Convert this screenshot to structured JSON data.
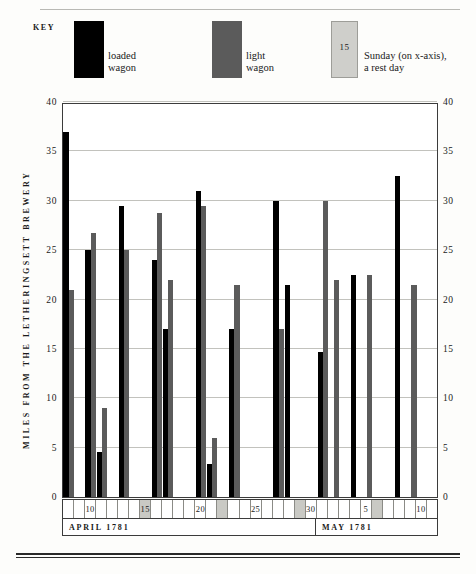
{
  "key": {
    "label": "KEY",
    "loaded_label": "loaded\nwagon",
    "loaded_line1": "loaded",
    "loaded_line2": "wagon",
    "light_line1": "light",
    "light_line2": "wagon",
    "sunday_swatch_number": "15",
    "sunday_line1": "Sunday (on x-axis),",
    "sunday_line2": "a rest day"
  },
  "colors": {
    "loaded_wagon": "#000000",
    "light_wagon": "#5b5b5b",
    "sunday_cell": "#c9c9c4",
    "gridline": "#c2c2bd",
    "axis": "#3b3b3b"
  },
  "chart_data": {
    "type": "bar",
    "title": "",
    "xlabel": "",
    "ylabel": "MILES FROM THE LETHERINGSETT BREWERY",
    "ylim": [
      0,
      40
    ],
    "yticks": [
      0,
      5,
      10,
      15,
      20,
      25,
      30,
      35,
      40
    ],
    "ytick_labels": [
      "0",
      "5",
      "10",
      "15",
      "20",
      "25",
      "30",
      "35",
      "40"
    ],
    "ytick_labels_right": [
      "0",
      "5",
      "10",
      "15",
      "20",
      "25",
      "30",
      "35",
      "40"
    ],
    "grid": true,
    "legend_position": "top",
    "series": [
      {
        "name": "loaded wagon",
        "color": "#000000"
      },
      {
        "name": "light wagon",
        "color": "#5b5b5b"
      }
    ],
    "months": [
      {
        "label": "APRIL  1781",
        "days": 23
      },
      {
        "label": "MAY  1781",
        "days": 11
      }
    ],
    "categories": [
      "8",
      "9",
      "10",
      "11",
      "12",
      "13",
      "14",
      "15",
      "16",
      "17",
      "18",
      "19",
      "20",
      "21",
      "22",
      "23",
      "24",
      "25",
      "26",
      "27",
      "28",
      "29",
      "30",
      "1",
      "2",
      "3",
      "4",
      "5",
      "6",
      "7",
      "8",
      "9",
      "10",
      "11"
    ],
    "tick_labels": {
      "10": "10",
      "15": "15",
      "20": "20",
      "25": "25",
      "30": "30",
      "1-May": "5",
      "10-May": "10"
    },
    "labelled_days": [
      "10",
      "15",
      "20",
      "25",
      "30",
      "5",
      "10"
    ],
    "sundays": [
      "15",
      "22",
      "29",
      "6"
    ],
    "days": [
      {
        "day": "8",
        "month": "APRIL",
        "sunday": false,
        "label": "",
        "loaded": 37,
        "light": 21
      },
      {
        "day": "9",
        "month": "APRIL",
        "sunday": false,
        "label": "",
        "loaded": 0,
        "light": 0
      },
      {
        "day": "10",
        "month": "APRIL",
        "sunday": false,
        "label": "10",
        "loaded": 25,
        "light": 26.7
      },
      {
        "day": "11",
        "month": "APRIL",
        "sunday": false,
        "label": "",
        "loaded": 4.6,
        "light": 9
      },
      {
        "day": "12",
        "month": "APRIL",
        "sunday": false,
        "label": "",
        "loaded": 0,
        "light": 0
      },
      {
        "day": "13",
        "month": "APRIL",
        "sunday": false,
        "label": "",
        "loaded": 29.5,
        "light": 25
      },
      {
        "day": "14",
        "month": "APRIL",
        "sunday": false,
        "label": "",
        "loaded": 0,
        "light": 0
      },
      {
        "day": "15",
        "month": "APRIL",
        "sunday": true,
        "label": "15",
        "loaded": 0,
        "light": 0
      },
      {
        "day": "16",
        "month": "APRIL",
        "sunday": false,
        "label": "",
        "loaded": 24,
        "light": 28.8
      },
      {
        "day": "17",
        "month": "APRIL",
        "sunday": false,
        "label": "",
        "loaded": 17,
        "light": 22
      },
      {
        "day": "18",
        "month": "APRIL",
        "sunday": false,
        "label": "",
        "loaded": 0,
        "light": 0
      },
      {
        "day": "19",
        "month": "APRIL",
        "sunday": false,
        "label": "",
        "loaded": 0,
        "light": 0
      },
      {
        "day": "20",
        "month": "APRIL",
        "sunday": false,
        "label": "20",
        "loaded": 31,
        "light": 29.5
      },
      {
        "day": "21",
        "month": "APRIL",
        "sunday": false,
        "label": "",
        "loaded": 3.3,
        "light": 6
      },
      {
        "day": "22",
        "month": "APRIL",
        "sunday": true,
        "label": "",
        "loaded": 0,
        "light": 0
      },
      {
        "day": "23",
        "month": "APRIL",
        "sunday": false,
        "label": "",
        "loaded": 17,
        "light": 21.5
      },
      {
        "day": "24",
        "month": "APRIL",
        "sunday": false,
        "label": "",
        "loaded": 0,
        "light": 0
      },
      {
        "day": "25",
        "month": "APRIL",
        "sunday": false,
        "label": "25",
        "loaded": 0,
        "light": 0
      },
      {
        "day": "26",
        "month": "APRIL",
        "sunday": false,
        "label": "",
        "loaded": 0,
        "light": 0
      },
      {
        "day": "27",
        "month": "APRIL",
        "sunday": false,
        "label": "",
        "loaded": 30,
        "light": 17
      },
      {
        "day": "28",
        "month": "APRIL",
        "sunday": false,
        "label": "",
        "loaded": 21.5,
        "light": 0
      },
      {
        "day": "29",
        "month": "APRIL",
        "sunday": true,
        "label": "",
        "loaded": 0,
        "light": 0
      },
      {
        "day": "30",
        "month": "APRIL",
        "sunday": false,
        "label": "30",
        "loaded": 0,
        "light": 0
      },
      {
        "day": "1",
        "month": "MAY",
        "sunday": false,
        "label": "",
        "loaded": 14.7,
        "light": 30
      },
      {
        "day": "2",
        "month": "MAY",
        "sunday": false,
        "label": "",
        "loaded": 0,
        "light": 22
      },
      {
        "day": "3",
        "month": "MAY",
        "sunday": false,
        "label": "",
        "loaded": 0,
        "light": 0
      },
      {
        "day": "4",
        "month": "MAY",
        "sunday": false,
        "label": "",
        "loaded": 22.5,
        "light": 0
      },
      {
        "day": "5",
        "month": "MAY",
        "sunday": false,
        "label": "5",
        "loaded": 0,
        "light": 22.5
      },
      {
        "day": "6",
        "month": "MAY",
        "sunday": true,
        "label": "",
        "loaded": 0,
        "light": 0
      },
      {
        "day": "7",
        "month": "MAY",
        "sunday": false,
        "label": "",
        "loaded": 0,
        "light": 0
      },
      {
        "day": "8",
        "month": "MAY",
        "sunday": false,
        "label": "",
        "loaded": 32.5,
        "light": 0
      },
      {
        "day": "9",
        "month": "MAY",
        "sunday": false,
        "label": "",
        "loaded": 0,
        "light": 21.5
      },
      {
        "day": "10",
        "month": "MAY",
        "sunday": false,
        "label": "10",
        "loaded": 0,
        "light": 0
      },
      {
        "day": "11",
        "month": "MAY",
        "sunday": false,
        "label": "",
        "loaded": 0,
        "light": 0
      }
    ]
  }
}
